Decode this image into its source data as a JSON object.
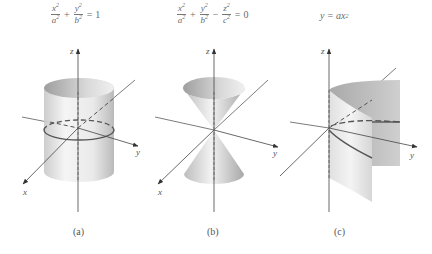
{
  "figure": {
    "panels": [
      {
        "id": "a",
        "caption": "(a)",
        "surface": "elliptic cylinder",
        "equation": {
          "term1_num": "x",
          "term1_den": "a",
          "op1": "+",
          "term2_num": "y",
          "term2_den": "b",
          "equals": "=",
          "rhs": "1",
          "exp": "2"
        },
        "axes": {
          "x": "x",
          "y": "y",
          "z": "z"
        }
      },
      {
        "id": "b",
        "caption": "(b)",
        "surface": "elliptic cone",
        "equation": {
          "term1_num": "x",
          "term1_den": "a",
          "op1": "+",
          "term2_num": "y",
          "term2_den": "b",
          "op2": "−",
          "term3_num": "z",
          "term3_den": "c",
          "equals": "=",
          "rhs": "0",
          "exp": "2"
        },
        "axes": {
          "x": "x",
          "y": "y",
          "z": "z"
        }
      },
      {
        "id": "c",
        "caption": "(c)",
        "surface": "parabolic cylinder",
        "equation": {
          "lhs": "y",
          "equals": "=",
          "rhs_base": "ax",
          "exp": "2"
        },
        "axes": {
          "x": "x",
          "y": "y",
          "z": "z"
        }
      }
    ],
    "colors": {
      "axis": "#444444",
      "surface_light": "#f2f2f2",
      "surface_dark": "#b8b8b8",
      "trace": "#555555"
    }
  }
}
